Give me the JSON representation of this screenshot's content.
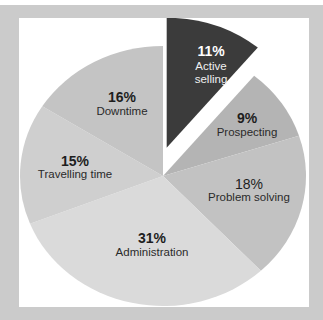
{
  "chart_data": {
    "type": "pie",
    "title": "",
    "start_angle_deg": 0,
    "direction": "clockwise",
    "legend": "none (labels inside slices)",
    "slices": [
      {
        "label": "Active selling",
        "value": 11,
        "display": "11%",
        "color": "#3b3b3b",
        "exploded": true
      },
      {
        "label": "Prospecting",
        "value": 9,
        "display": "9%",
        "color": "#b4b4b4",
        "exploded": false
      },
      {
        "label": "Problem solving",
        "value": 18,
        "display": "18%",
        "color": "#c2c2c2",
        "exploded": false
      },
      {
        "label": "Administration",
        "value": 31,
        "display": "31%",
        "color": "#dadada",
        "exploded": false
      },
      {
        "label": "Travelling time",
        "value": 15,
        "display": "15%",
        "color": "#cfcfcf",
        "exploded": false
      },
      {
        "label": "Downtime",
        "value": 16,
        "display": "16%",
        "color": "#c4c4c4",
        "exploded": false
      }
    ]
  },
  "labels": {
    "active_selling": {
      "pct": "11%",
      "line1": "Active",
      "line2": "selling"
    },
    "prospecting": {
      "pct": "9%",
      "name": "Prospecting"
    },
    "problem_solving": {
      "pct": "18%",
      "name": "Problem solving"
    },
    "administration": {
      "pct": "31%",
      "name": "Administration"
    },
    "travelling_time": {
      "pct": "15%",
      "name": "Travelling time"
    },
    "downtime": {
      "pct": "16%",
      "name": "Downtime"
    }
  },
  "colors": {
    "frame": "#cbcbcb",
    "panel": "#ffffff"
  }
}
